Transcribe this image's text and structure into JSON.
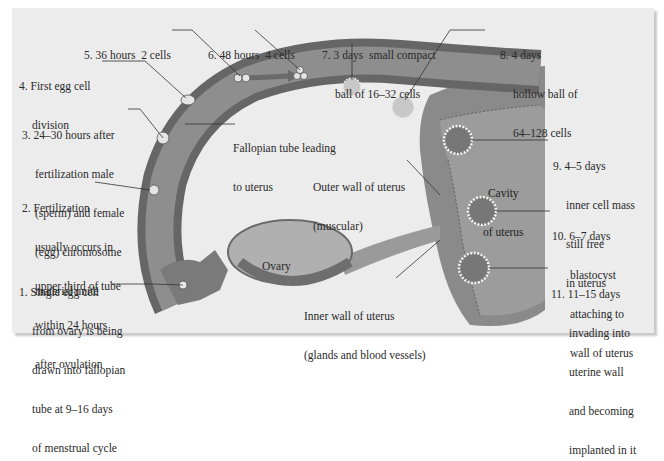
{
  "diagram": {
    "colors": {
      "background": "#ececec",
      "tube_wall": "#6a6a6a",
      "tube_lumen": "#8c8c8c",
      "uterus": "#8a8a8a",
      "cavity": "#a0a0a0",
      "text": "#2a2a2a"
    },
    "stages": [
      {
        "id": 1,
        "lines": [
          "1. Single egg cell",
          "from ovary is being",
          "drawn into fallopian",
          "tube at 9–16 days",
          "of menstrual cycle"
        ]
      },
      {
        "id": 2,
        "lines": [
          "2. Fertilization",
          "usually occurs in",
          "upper third of tube",
          "within 24 hours",
          "after ovulation"
        ]
      },
      {
        "id": 3,
        "lines": [
          "3. 24–30 hours after",
          "fertilization male",
          "(sperm) and female",
          "(egg) chromosome",
          "material unite"
        ]
      },
      {
        "id": 4,
        "lines": [
          "4. First egg cell",
          "division"
        ]
      },
      {
        "id": 5,
        "lines": [
          "5. 36 hours  2 cells"
        ]
      },
      {
        "id": 6,
        "lines": [
          "6. 48 hours  4 cells"
        ]
      },
      {
        "id": 7,
        "lines": [
          "7. 3 days  small compact",
          "ball of 16–32 cells"
        ]
      },
      {
        "id": 8,
        "lines": [
          "8. 4 days",
          "hollow ball of",
          "64–128 cells"
        ]
      },
      {
        "id": 9,
        "lines": [
          "9. 4–5 days",
          "inner cell mass",
          "still free",
          "in uterus"
        ]
      },
      {
        "id": 10,
        "lines": [
          "10. 6–7 days",
          "blastocyst",
          "attaching to",
          "wall of uterus"
        ]
      },
      {
        "id": 11,
        "lines": [
          "11. 11–15 days",
          "invading into",
          "uterine wall",
          "and becoming",
          "implanted in it"
        ]
      }
    ],
    "structures": {
      "fallopian_tube": [
        "Fallopian tube leading",
        "to uterus"
      ],
      "outer_wall": [
        "Outer wall of uterus",
        "(muscular)"
      ],
      "inner_wall": [
        "Inner wall of uterus",
        "(glands and blood vessels)"
      ],
      "cavity": [
        "Cavity",
        "of uterus"
      ],
      "ovary": "Ovary"
    }
  }
}
